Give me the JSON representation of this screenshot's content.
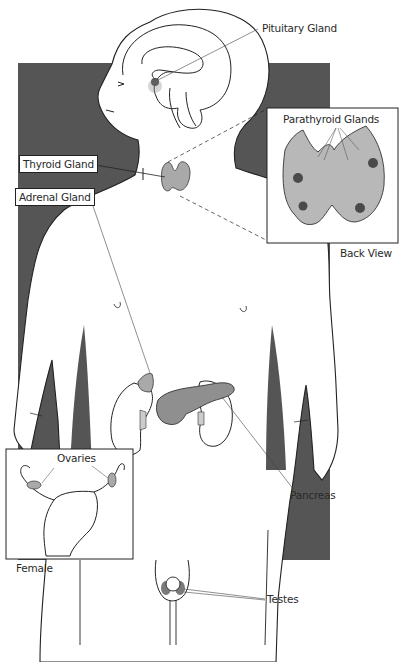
{
  "diagram": {
    "colors": {
      "background": "#ffffff",
      "backdrop": "#555555",
      "outline": "#222222",
      "gland_fill": "#a9a9a9",
      "gland_dark": "#4a4a4a"
    },
    "labels": {
      "pituitary": "Pituitary Gland",
      "thyroid": "Thyroid Gland",
      "adrenal": "Adrenal Gland",
      "parathyroid": "Parathyroid Glands",
      "back_view": "Back View",
      "pancreas": "Pancreas",
      "ovaries": "Ovaries",
      "female": "Female",
      "testes": "Testes"
    },
    "insets": [
      {
        "name": "parathyroid-inset",
        "caption": "Back View",
        "label": "Parathyroid Glands"
      },
      {
        "name": "female-inset",
        "caption": "Female",
        "label": "Ovaries"
      }
    ]
  }
}
